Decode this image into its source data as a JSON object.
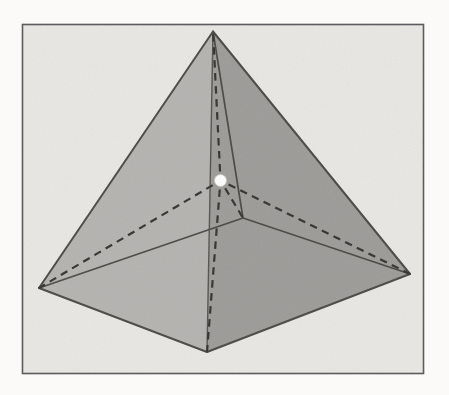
{
  "figure": {
    "type": "geometry-diagram",
    "canvas": {
      "width": 449,
      "height": 395,
      "page_color": "#fbfaf8"
    },
    "frame": {
      "x": 22.5,
      "y": 24.5,
      "width": 401,
      "height": 349,
      "stroke": "#58585a",
      "stroke_width": 1.6,
      "fill": "#e8e7e3"
    },
    "colors": {
      "left_face": "#b4b3b0",
      "right_face": "#9c9b98",
      "edge": "#4a4944",
      "front_edge": "#55534e",
      "dashed": "#34332f",
      "point_fill": "#fdfdfb",
      "point_edge": "#c9c8c4"
    },
    "vertices": {
      "apex": [
        213,
        31.5
      ],
      "base_left": [
        39,
        288
      ],
      "base_front": [
        207,
        352
      ],
      "base_right": [
        410,
        274
      ],
      "base_back": [
        243,
        218
      ]
    },
    "interior_point": {
      "x": 220.5,
      "y": 180.5,
      "radius": 6
    },
    "faces": [
      {
        "name": "left-face",
        "vertices": [
          "apex",
          "base_left",
          "base_front"
        ],
        "fill_key": "left_face"
      },
      {
        "name": "right-face",
        "vertices": [
          "apex",
          "base_front",
          "base_right"
        ],
        "fill_key": "right_face"
      }
    ],
    "solid_edges": [
      {
        "name": "edge-apex-base-front",
        "from": "apex",
        "to": "base_front",
        "width": 1.4,
        "color_key": "front_edge"
      },
      {
        "name": "edge-apex-base-back",
        "from": "apex",
        "to": "base_back",
        "width": 1.7,
        "color_key": "edge"
      },
      {
        "name": "edge-base-left-back",
        "from": "base_left",
        "to": "base_back",
        "width": 1.7,
        "color_key": "edge"
      },
      {
        "name": "edge-base-back-right",
        "from": "base_back",
        "to": "base_right",
        "width": 1.7,
        "color_key": "edge"
      },
      {
        "name": "edge-apex-base-left",
        "from": "apex",
        "to": "base_left",
        "width": 2.0,
        "color_key": "edge"
      },
      {
        "name": "edge-apex-base-right",
        "from": "apex",
        "to": "base_right",
        "width": 2.0,
        "color_key": "edge"
      },
      {
        "name": "edge-base-left-front",
        "from": "base_left",
        "to": "base_front",
        "width": 2.0,
        "color_key": "edge"
      },
      {
        "name": "edge-base-front-right",
        "from": "base_front",
        "to": "base_right",
        "width": 2.0,
        "color_key": "edge"
      }
    ],
    "dashed_segments": [
      {
        "name": "dashed-point-apex",
        "to": "apex"
      },
      {
        "name": "dashed-point-base-left",
        "to": "base_left"
      },
      {
        "name": "dashed-point-base-front",
        "to": "base_front"
      },
      {
        "name": "dashed-point-base-right",
        "to": "base_right"
      },
      {
        "name": "dashed-point-base-back",
        "to": "base_back"
      }
    ],
    "dash_style": {
      "stroke_width": 2.2,
      "dasharray": "7.5 5.5",
      "gap_from_point": 3
    }
  }
}
